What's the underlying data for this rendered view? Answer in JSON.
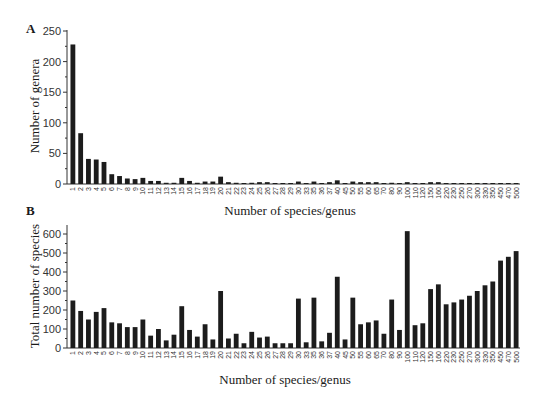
{
  "panels": {
    "A": {
      "letter": "A",
      "ylabel": "Number of genera",
      "xlabel": "Number of species/genus"
    },
    "B": {
      "letter": "B",
      "ylabel": "Total number of species",
      "xlabel": "Number of species/genus"
    }
  },
  "colors": {
    "bar": "#1c1c1c",
    "axis": "#333333",
    "background": "#ffffff"
  },
  "chart_data": [
    {
      "type": "bar",
      "title": "A",
      "xlabel": "Number of species/genus",
      "ylabel": "Number of genera",
      "ylim": [
        0,
        250
      ],
      "yticks": [
        0,
        50,
        100,
        150,
        200,
        250
      ],
      "grid": false,
      "categories": [
        "1",
        "2",
        "3",
        "4",
        "5",
        "6",
        "7",
        "8",
        "9",
        "10",
        "11",
        "12",
        "13",
        "14",
        "15",
        "16",
        "17",
        "18",
        "19",
        "20",
        "21",
        "22",
        "23",
        "24",
        "25",
        "26",
        "27",
        "28",
        "29",
        "30",
        "33",
        "35",
        "36",
        "37",
        "40",
        "45",
        "50",
        "55",
        "60",
        "65",
        "70",
        "80",
        "90",
        "100",
        "110",
        "120",
        "150",
        "160",
        "220",
        "230",
        "250",
        "270",
        "300",
        "330",
        "350",
        "450",
        "470",
        "500"
      ],
      "values": [
        228,
        83,
        41,
        40,
        36,
        16,
        13,
        9,
        8,
        10,
        5,
        5,
        2,
        2,
        10,
        5,
        2,
        4,
        4,
        12,
        3,
        2,
        1,
        2,
        3,
        3,
        1,
        1,
        1,
        4,
        1,
        4,
        1,
        3,
        6,
        1,
        4,
        3,
        3,
        3,
        1,
        2,
        1,
        3,
        1,
        1,
        3,
        3,
        1,
        1,
        1,
        1,
        1,
        1,
        1,
        1,
        1,
        1
      ]
    },
    {
      "type": "bar",
      "title": "B",
      "xlabel": "Number of species/genus",
      "ylabel": "Total number of species",
      "ylim": [
        0,
        620
      ],
      "yticks": [
        0,
        100,
        200,
        300,
        400,
        500,
        600
      ],
      "grid": false,
      "categories": [
        "1",
        "2",
        "3",
        "4",
        "5",
        "6",
        "7",
        "8",
        "9",
        "10",
        "11",
        "12",
        "13",
        "14",
        "15",
        "16",
        "17",
        "18",
        "19",
        "20",
        "21",
        "22",
        "23",
        "24",
        "25",
        "26",
        "27",
        "28",
        "29",
        "30",
        "33",
        "35",
        "36",
        "37",
        "40",
        "45",
        "50",
        "55",
        "60",
        "65",
        "70",
        "80",
        "90",
        "100",
        "110",
        "120",
        "150",
        "160",
        "220",
        "230",
        "250",
        "270",
        "300",
        "330",
        "350",
        "450",
        "470",
        "500"
      ],
      "values": [
        250,
        195,
        150,
        190,
        210,
        135,
        130,
        110,
        110,
        150,
        65,
        100,
        40,
        70,
        220,
        95,
        60,
        125,
        45,
        300,
        50,
        75,
        25,
        85,
        55,
        60,
        25,
        25,
        25,
        260,
        30,
        265,
        35,
        80,
        375,
        45,
        265,
        125,
        135,
        145,
        75,
        255,
        95,
        615,
        120,
        130,
        310,
        335,
        230,
        240,
        255,
        275,
        300,
        330,
        350,
        460,
        480,
        510
      ]
    }
  ]
}
